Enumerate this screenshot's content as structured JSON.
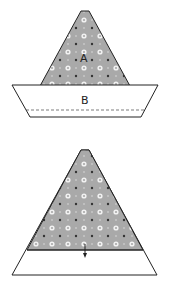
{
  "diagram": {
    "top_figure": {
      "label_a": "A",
      "label_b": "B"
    },
    "bottom_figure": {
      "arrow": "down-arrow"
    },
    "colors": {
      "fabric_fill": "#a9a9a9",
      "dot_white": "#f2f2f2",
      "dot_dark": "#333333",
      "outline": "#222222",
      "background": "#ffffff"
    }
  }
}
